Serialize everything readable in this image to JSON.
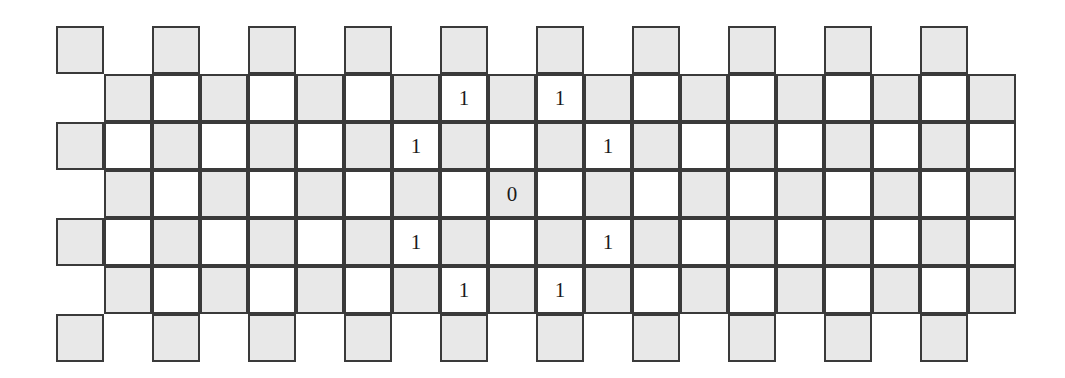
{
  "figure": {
    "type": "grid-diagram",
    "colors": {
      "cell_fill_shaded": "#e8e8e8",
      "cell_fill_plain": "#ffffff",
      "cell_border": "#3a3a3a",
      "glyph_color": "#1a1a1a",
      "background": "#ffffff"
    },
    "geometry": {
      "cell_size": 48,
      "cell_pitch": 48,
      "row_count": 7,
      "even_row_origin_x": 56,
      "odd_row_origin_x": 104,
      "origin_y": 26,
      "even_row_columns": 10,
      "odd_row_columns": 19
    }
  },
  "chart_data": {
    "type": "heatmap",
    "xlabel": "",
    "ylabel": "",
    "grid": true,
    "legend": "",
    "rows": [
      {
        "row_index": 0,
        "origin_x": 56,
        "origin_y": 26,
        "cells": [
          {
            "col": 0,
            "fill": "gray",
            "label": ""
          },
          {
            "col": 2,
            "fill": "gray",
            "label": ""
          },
          {
            "col": 4,
            "fill": "gray",
            "label": ""
          },
          {
            "col": 6,
            "fill": "gray",
            "label": ""
          },
          {
            "col": 8,
            "fill": "gray",
            "label": ""
          },
          {
            "col": 10,
            "fill": "gray",
            "label": ""
          },
          {
            "col": 12,
            "fill": "gray",
            "label": ""
          },
          {
            "col": 14,
            "fill": "gray",
            "label": ""
          },
          {
            "col": 16,
            "fill": "gray",
            "label": ""
          },
          {
            "col": 18,
            "fill": "gray",
            "label": ""
          }
        ]
      },
      {
        "row_index": 1,
        "origin_x": 104,
        "origin_y": 74,
        "cells": [
          {
            "col": 0,
            "fill": "gray",
            "label": ""
          },
          {
            "col": 1,
            "fill": "white",
            "label": ""
          },
          {
            "col": 2,
            "fill": "gray",
            "label": ""
          },
          {
            "col": 3,
            "fill": "white",
            "label": ""
          },
          {
            "col": 4,
            "fill": "gray",
            "label": ""
          },
          {
            "col": 5,
            "fill": "white",
            "label": ""
          },
          {
            "col": 6,
            "fill": "gray",
            "label": ""
          },
          {
            "col": 7,
            "fill": "white",
            "label": "1"
          },
          {
            "col": 8,
            "fill": "gray",
            "label": ""
          },
          {
            "col": 9,
            "fill": "white",
            "label": "1"
          },
          {
            "col": 10,
            "fill": "gray",
            "label": ""
          },
          {
            "col": 11,
            "fill": "white",
            "label": ""
          },
          {
            "col": 12,
            "fill": "gray",
            "label": ""
          },
          {
            "col": 13,
            "fill": "white",
            "label": ""
          },
          {
            "col": 14,
            "fill": "gray",
            "label": ""
          },
          {
            "col": 15,
            "fill": "white",
            "label": ""
          },
          {
            "col": 16,
            "fill": "gray",
            "label": ""
          },
          {
            "col": 17,
            "fill": "white",
            "label": ""
          },
          {
            "col": 18,
            "fill": "gray",
            "label": ""
          }
        ]
      },
      {
        "row_index": 2,
        "origin_x": 56,
        "origin_y": 122,
        "cells": [
          {
            "col": 0,
            "fill": "gray",
            "label": ""
          },
          {
            "col": 1,
            "fill": "white",
            "label": ""
          },
          {
            "col": 2,
            "fill": "gray",
            "label": ""
          },
          {
            "col": 3,
            "fill": "white",
            "label": ""
          },
          {
            "col": 4,
            "fill": "gray",
            "label": ""
          },
          {
            "col": 5,
            "fill": "white",
            "label": ""
          },
          {
            "col": 6,
            "fill": "gray",
            "label": ""
          },
          {
            "col": 7,
            "fill": "white",
            "label": "1"
          },
          {
            "col": 8,
            "fill": "gray",
            "label": ""
          },
          {
            "col": 9,
            "fill": "white",
            "label": ""
          },
          {
            "col": 10,
            "fill": "gray",
            "label": ""
          },
          {
            "col": 11,
            "fill": "white",
            "label": "1"
          },
          {
            "col": 12,
            "fill": "gray",
            "label": ""
          },
          {
            "col": 13,
            "fill": "white",
            "label": ""
          },
          {
            "col": 14,
            "fill": "gray",
            "label": ""
          },
          {
            "col": 15,
            "fill": "white",
            "label": ""
          },
          {
            "col": 16,
            "fill": "gray",
            "label": ""
          },
          {
            "col": 17,
            "fill": "white",
            "label": ""
          },
          {
            "col": 18,
            "fill": "gray",
            "label": ""
          },
          {
            "col": 19,
            "fill": "white",
            "label": ""
          }
        ]
      },
      {
        "row_index": 3,
        "origin_x": 104,
        "origin_y": 170,
        "cells": [
          {
            "col": 0,
            "fill": "gray",
            "label": ""
          },
          {
            "col": 1,
            "fill": "white",
            "label": ""
          },
          {
            "col": 2,
            "fill": "gray",
            "label": ""
          },
          {
            "col": 3,
            "fill": "white",
            "label": ""
          },
          {
            "col": 4,
            "fill": "gray",
            "label": ""
          },
          {
            "col": 5,
            "fill": "white",
            "label": ""
          },
          {
            "col": 6,
            "fill": "gray",
            "label": ""
          },
          {
            "col": 7,
            "fill": "white",
            "label": ""
          },
          {
            "col": 8,
            "fill": "gray",
            "label": "0"
          },
          {
            "col": 9,
            "fill": "white",
            "label": ""
          },
          {
            "col": 10,
            "fill": "gray",
            "label": ""
          },
          {
            "col": 11,
            "fill": "white",
            "label": ""
          },
          {
            "col": 12,
            "fill": "gray",
            "label": ""
          },
          {
            "col": 13,
            "fill": "white",
            "label": ""
          },
          {
            "col": 14,
            "fill": "gray",
            "label": ""
          },
          {
            "col": 15,
            "fill": "white",
            "label": ""
          },
          {
            "col": 16,
            "fill": "gray",
            "label": ""
          },
          {
            "col": 17,
            "fill": "white",
            "label": ""
          },
          {
            "col": 18,
            "fill": "gray",
            "label": ""
          }
        ]
      },
      {
        "row_index": 4,
        "origin_x": 56,
        "origin_y": 218,
        "cells": [
          {
            "col": 0,
            "fill": "gray",
            "label": ""
          },
          {
            "col": 1,
            "fill": "white",
            "label": ""
          },
          {
            "col": 2,
            "fill": "gray",
            "label": ""
          },
          {
            "col": 3,
            "fill": "white",
            "label": ""
          },
          {
            "col": 4,
            "fill": "gray",
            "label": ""
          },
          {
            "col": 5,
            "fill": "white",
            "label": ""
          },
          {
            "col": 6,
            "fill": "gray",
            "label": ""
          },
          {
            "col": 7,
            "fill": "white",
            "label": "1"
          },
          {
            "col": 8,
            "fill": "gray",
            "label": ""
          },
          {
            "col": 9,
            "fill": "white",
            "label": ""
          },
          {
            "col": 10,
            "fill": "gray",
            "label": ""
          },
          {
            "col": 11,
            "fill": "white",
            "label": "1"
          },
          {
            "col": 12,
            "fill": "gray",
            "label": ""
          },
          {
            "col": 13,
            "fill": "white",
            "label": ""
          },
          {
            "col": 14,
            "fill": "gray",
            "label": ""
          },
          {
            "col": 15,
            "fill": "white",
            "label": ""
          },
          {
            "col": 16,
            "fill": "gray",
            "label": ""
          },
          {
            "col": 17,
            "fill": "white",
            "label": ""
          },
          {
            "col": 18,
            "fill": "gray",
            "label": ""
          },
          {
            "col": 19,
            "fill": "white",
            "label": ""
          }
        ]
      },
      {
        "row_index": 5,
        "origin_x": 104,
        "origin_y": 266,
        "cells": [
          {
            "col": 0,
            "fill": "gray",
            "label": ""
          },
          {
            "col": 1,
            "fill": "white",
            "label": ""
          },
          {
            "col": 2,
            "fill": "gray",
            "label": ""
          },
          {
            "col": 3,
            "fill": "white",
            "label": ""
          },
          {
            "col": 4,
            "fill": "gray",
            "label": ""
          },
          {
            "col": 5,
            "fill": "white",
            "label": ""
          },
          {
            "col": 6,
            "fill": "gray",
            "label": ""
          },
          {
            "col": 7,
            "fill": "white",
            "label": "1"
          },
          {
            "col": 8,
            "fill": "gray",
            "label": ""
          },
          {
            "col": 9,
            "fill": "white",
            "label": "1"
          },
          {
            "col": 10,
            "fill": "gray",
            "label": ""
          },
          {
            "col": 11,
            "fill": "white",
            "label": ""
          },
          {
            "col": 12,
            "fill": "gray",
            "label": ""
          },
          {
            "col": 13,
            "fill": "white",
            "label": ""
          },
          {
            "col": 14,
            "fill": "gray",
            "label": ""
          },
          {
            "col": 15,
            "fill": "white",
            "label": ""
          },
          {
            "col": 16,
            "fill": "gray",
            "label": ""
          },
          {
            "col": 17,
            "fill": "white",
            "label": ""
          },
          {
            "col": 18,
            "fill": "gray",
            "label": ""
          }
        ]
      },
      {
        "row_index": 6,
        "origin_x": 56,
        "origin_y": 314,
        "cells": [
          {
            "col": 0,
            "fill": "gray",
            "label": ""
          },
          {
            "col": 2,
            "fill": "gray",
            "label": ""
          },
          {
            "col": 4,
            "fill": "gray",
            "label": ""
          },
          {
            "col": 6,
            "fill": "gray",
            "label": ""
          },
          {
            "col": 8,
            "fill": "gray",
            "label": ""
          },
          {
            "col": 10,
            "fill": "gray",
            "label": ""
          },
          {
            "col": 12,
            "fill": "gray",
            "label": ""
          },
          {
            "col": 14,
            "fill": "gray",
            "label": ""
          },
          {
            "col": 16,
            "fill": "gray",
            "label": ""
          },
          {
            "col": 18,
            "fill": "gray",
            "label": ""
          }
        ]
      }
    ],
    "labels": [
      {
        "value": "1",
        "row": 1,
        "col": 7
      },
      {
        "value": "1",
        "row": 1,
        "col": 9
      },
      {
        "value": "1",
        "row": 2,
        "col": 7
      },
      {
        "value": "1",
        "row": 2,
        "col": 11
      },
      {
        "value": "0",
        "row": 3,
        "col": 8
      },
      {
        "value": "1",
        "row": 4,
        "col": 7
      },
      {
        "value": "1",
        "row": 4,
        "col": 11
      },
      {
        "value": "1",
        "row": 5,
        "col": 7
      },
      {
        "value": "1",
        "row": 5,
        "col": 9
      }
    ]
  }
}
